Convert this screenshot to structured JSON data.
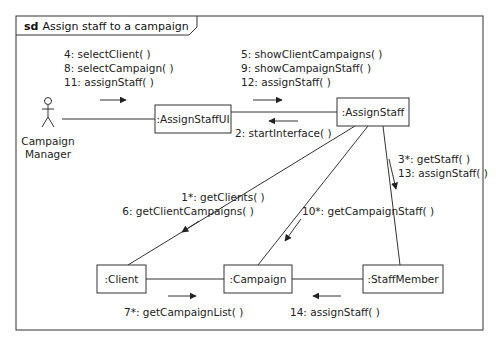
{
  "frame": {
    "keyword": "sd",
    "title": "Assign staff to a campaign"
  },
  "actor": {
    "name_line1": "Campaign",
    "name_line2": "Manager"
  },
  "objects": {
    "assign_staff_ui": ":AssignStaffUI",
    "assign_staff": ":AssignStaff",
    "client": ":Client",
    "campaign": ":Campaign",
    "staff_member": ":StaffMember"
  },
  "messages": {
    "actor_to_ui": [
      "4: selectClient( )",
      "8: selectCampaign( )",
      "11: assignStaff( )"
    ],
    "ui_to_control": [
      "5: showClientCampaigns( )",
      "9: showCampaignStaff( )",
      "12: assignStaff( )"
    ],
    "control_to_ui": [
      "2: startInterface( )"
    ],
    "control_to_client": [
      "1*: getClients( )",
      "6: getClientCampaigns( )"
    ],
    "control_to_campaign": [
      "10*: getCampaignStaff( )"
    ],
    "control_to_staff": [
      "3*: getStaff( )",
      "13: assignStaff( )"
    ],
    "client_to_campaign": [
      "7*: getCampaignList( )"
    ],
    "staff_to_campaign": [
      "14: assignStaff( )"
    ]
  }
}
